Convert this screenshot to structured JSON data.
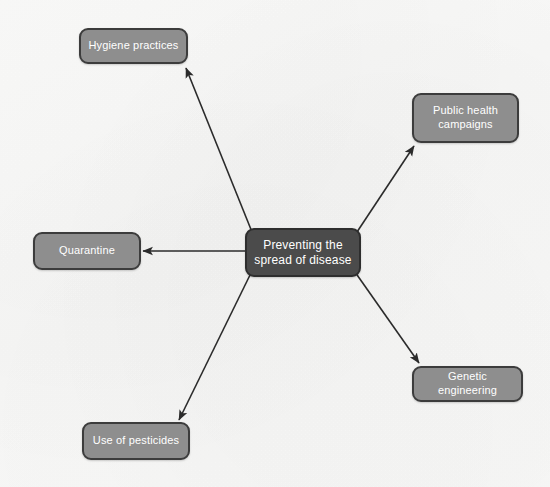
{
  "diagram": {
    "type": "mind-map",
    "title": "Preventing the spread of disease",
    "background_color": "#f8f8f7",
    "central_node": {
      "id": "central",
      "label": "Preventing the\nspread of disease",
      "fill_color": "#4b4b4b",
      "border_color": "#2e2e2e",
      "text_color": "#ffffff",
      "x": 245,
      "y": 228,
      "width": 116,
      "height": 49
    },
    "satellite_nodes": [
      {
        "id": "hygiene-practices",
        "label": "Hygiene practices",
        "fill_color": "#8e8e8e",
        "border_color": "#3c3c3c",
        "text_color": "#ffffff",
        "x": 79,
        "y": 28,
        "width": 109,
        "height": 36
      },
      {
        "id": "public-health-campaigns",
        "label": "Public health\ncampaigns",
        "fill_color": "#8e8e8e",
        "border_color": "#3c3c3c",
        "text_color": "#ffffff",
        "x": 412,
        "y": 93,
        "width": 107,
        "height": 50
      },
      {
        "id": "quarantine",
        "label": "Quarantine",
        "fill_color": "#8e8e8e",
        "border_color": "#3c3c3c",
        "text_color": "#ffffff",
        "x": 33,
        "y": 232,
        "width": 108,
        "height": 38
      },
      {
        "id": "genetic-engineering",
        "label": "Genetic engineering",
        "fill_color": "#8e8e8e",
        "border_color": "#3c3c3c",
        "text_color": "#ffffff",
        "x": 412,
        "y": 366,
        "width": 111,
        "height": 36
      },
      {
        "id": "use-of-pesticides",
        "label": "Use of pesticides",
        "fill_color": "#8e8e8e",
        "border_color": "#3c3c3c",
        "text_color": "#ffffff",
        "x": 82,
        "y": 422,
        "width": 108,
        "height": 38
      }
    ],
    "edges": [
      {
        "id": "edge-hygiene-practices",
        "from": "central",
        "to": "hygiene-practices",
        "x1": 252,
        "y1": 232,
        "x2": 186,
        "y2": 68,
        "color": "#2b2b2b",
        "arrowhead": "end"
      },
      {
        "id": "edge-public-health-campaigns",
        "from": "central",
        "to": "public-health-campaigns",
        "x1": 355,
        "y1": 235,
        "x2": 414,
        "y2": 146,
        "color": "#2b2b2b",
        "arrowhead": "end"
      },
      {
        "id": "edge-quarantine",
        "from": "central",
        "to": "quarantine",
        "x1": 245,
        "y1": 251,
        "x2": 143,
        "y2": 251,
        "color": "#2b2b2b",
        "arrowhead": "end"
      },
      {
        "id": "edge-genetic-engineering",
        "from": "central",
        "to": "genetic-engineering",
        "x1": 355,
        "y1": 272,
        "x2": 419,
        "y2": 363,
        "color": "#2b2b2b",
        "arrowhead": "end"
      },
      {
        "id": "edge-use-of-pesticides",
        "from": "central",
        "to": "use-of-pesticides",
        "x1": 250,
        "y1": 275,
        "x2": 179,
        "y2": 420,
        "color": "#2b2b2b",
        "arrowhead": "end"
      }
    ]
  }
}
